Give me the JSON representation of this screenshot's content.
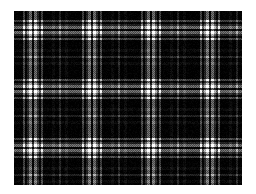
{
  "image": {
    "title": "Tartan Plaid Swatch",
    "kind": "textile-pattern",
    "width": 256,
    "height": 194,
    "background_color": "#ffffff"
  },
  "pattern": {
    "name": "black-and-white-tartan",
    "weave": "twill-plaid",
    "symmetry": "symmetric-sett",
    "repeat_px": 59,
    "region": {
      "x": 14,
      "y": 11,
      "width": 228,
      "height": 174
    },
    "palette": {
      "black": "#000000",
      "dark_gray": "#2b2b2b",
      "mid_gray": "#6e6e6e",
      "light_gray": "#b4b4b4",
      "white": "#ffffff"
    },
    "sett": [
      {
        "color": "black",
        "width": 9
      },
      {
        "color": "light_gray",
        "width": 2
      },
      {
        "color": "black",
        "width": 2
      },
      {
        "color": "mid_gray",
        "width": 2
      },
      {
        "color": "white",
        "width": 3
      },
      {
        "color": "black",
        "width": 2
      },
      {
        "color": "white",
        "width": 3
      },
      {
        "color": "mid_gray",
        "width": 2
      },
      {
        "color": "black",
        "width": 2
      },
      {
        "color": "light_gray",
        "width": 2
      },
      {
        "color": "black",
        "width": 9
      },
      {
        "color": "dark_gray",
        "width": 3
      },
      {
        "color": "black",
        "width": 4
      },
      {
        "color": "mid_gray",
        "width": 2
      },
      {
        "color": "black",
        "width": 4
      },
      {
        "color": "dark_gray",
        "width": 3
      },
      {
        "color": "black",
        "width": 5
      }
    ],
    "blend": "multiply",
    "noise_amount": 0.07
  }
}
